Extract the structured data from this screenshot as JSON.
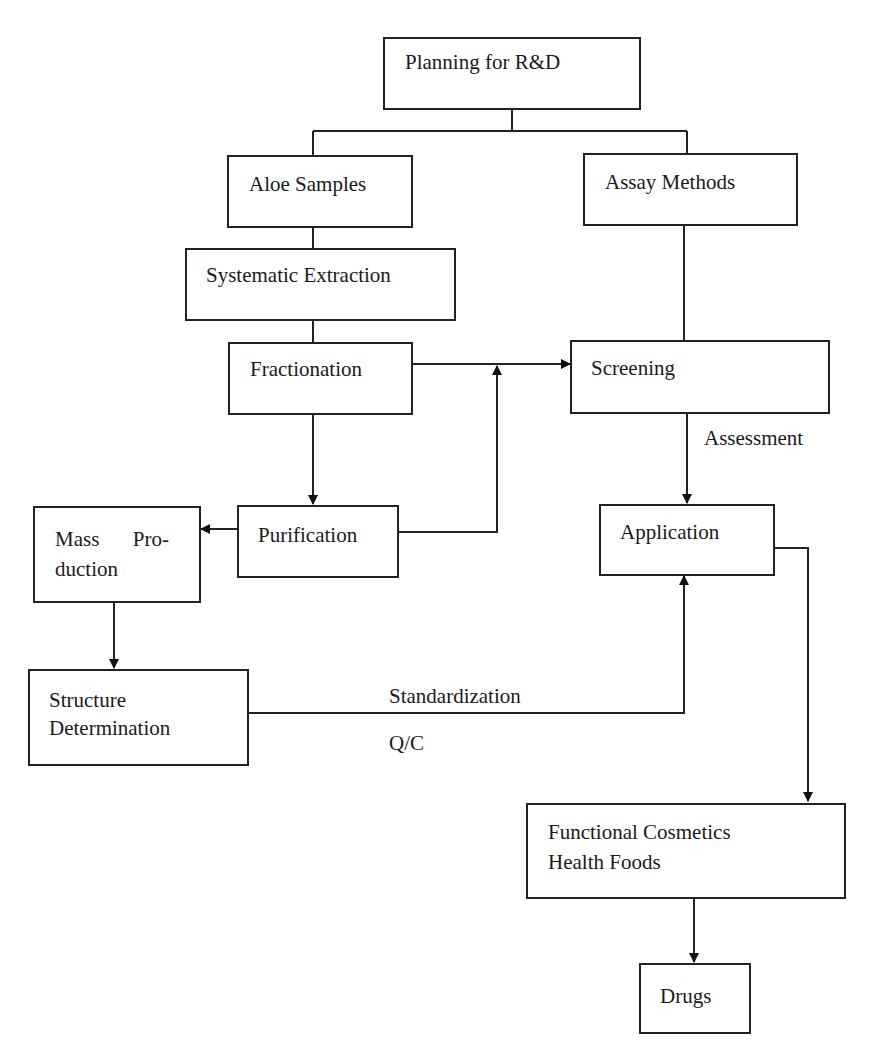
{
  "diagram": {
    "type": "flowchart",
    "nodes": {
      "planning": "Planning for R&D",
      "aloe_samples": "Aloe Samples",
      "assay_methods": "Assay Methods",
      "systematic_extraction": "Systematic Extraction",
      "fractionation": "Fractionation",
      "screening": "Screening",
      "purification": "Purification",
      "mass_production_line1_a": "Mass",
      "mass_production_line1_b": "Pro-",
      "mass_production_line2": "duction",
      "application": "Application",
      "structure_line1": "Structure",
      "structure_line2": "Determination",
      "functional_line1": "Functional Cosmetics",
      "functional_line2": "Health Foods",
      "drugs": "Drugs"
    },
    "edge_labels": {
      "assessment": "Assessment",
      "standardization": "Standardization",
      "qc": "Q/C"
    },
    "edges": [
      {
        "from": "Planning for R&D",
        "to": "Aloe Samples"
      },
      {
        "from": "Planning for R&D",
        "to": "Assay Methods"
      },
      {
        "from": "Aloe Samples",
        "to": "Systematic Extraction"
      },
      {
        "from": "Systematic Extraction",
        "to": "Fractionation"
      },
      {
        "from": "Fractionation",
        "to": "Screening"
      },
      {
        "from": "Assay Methods",
        "to": "Screening"
      },
      {
        "from": "Fractionation",
        "to": "Purification"
      },
      {
        "from": "Purification",
        "to": "Screening"
      },
      {
        "from": "Purification",
        "to": "Mass Production"
      },
      {
        "from": "Mass Production",
        "to": "Structure Determination"
      },
      {
        "from": "Screening",
        "to": "Application",
        "label": "Assessment"
      },
      {
        "from": "Structure Determination",
        "to": "Application",
        "label": "Standardization / Q/C"
      },
      {
        "from": "Application",
        "to": "Functional Cosmetics Health Foods"
      },
      {
        "from": "Functional Cosmetics Health Foods",
        "to": "Drugs"
      }
    ],
    "colors": {
      "line": "#222222",
      "background": "#ffffff",
      "text": "#1a1a1a"
    }
  }
}
